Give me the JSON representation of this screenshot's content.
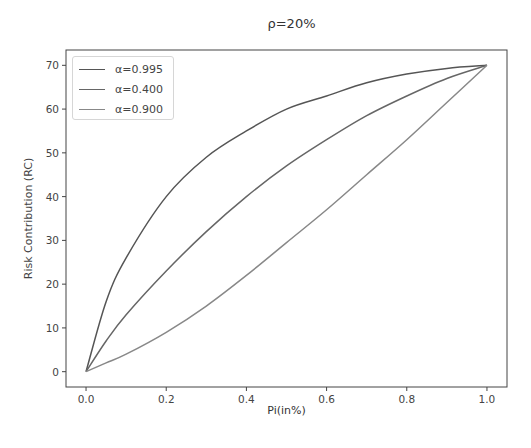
{
  "chart_data": {
    "type": "line",
    "title": "ρ=20%",
    "xlabel": "Pi(in%)",
    "ylabel": "Risk Contribution (RC)",
    "xlim": [
      -0.05,
      1.05
    ],
    "ylim": [
      -3.5,
      73.5
    ],
    "xticks": [
      "0.0",
      "0.2",
      "0.4",
      "0.6",
      "0.8",
      "1.0"
    ],
    "yticks": [
      "0",
      "10",
      "20",
      "30",
      "40",
      "50",
      "60",
      "70"
    ],
    "grid": false,
    "legend_position": "upper left",
    "x": [
      0.0,
      0.05,
      0.1,
      0.2,
      0.3,
      0.4,
      0.5,
      0.6,
      0.7,
      0.8,
      0.9,
      1.0
    ],
    "series": [
      {
        "name": "α=0.995",
        "color": "#555555",
        "values": [
          0,
          16,
          26,
          40,
          49,
          55,
          60,
          63,
          66,
          68,
          69.3,
          70
        ]
      },
      {
        "name": "α=0.400",
        "color": "#666666",
        "values": [
          0,
          7,
          13,
          23,
          32,
          40,
          47,
          53,
          58.5,
          63,
          67,
          70
        ]
      },
      {
        "name": "α=0.900",
        "color": "#888888",
        "values": [
          0,
          2,
          4,
          9,
          15,
          22,
          29.5,
          37,
          45,
          53,
          61.5,
          70
        ]
      }
    ]
  },
  "legend": {
    "items": [
      {
        "label": "α=0.995"
      },
      {
        "label": "α=0.400"
      },
      {
        "label": "α=0.900"
      }
    ]
  }
}
